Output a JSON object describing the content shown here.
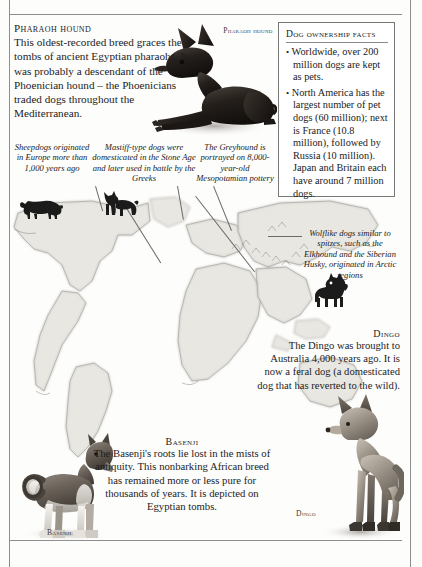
{
  "page": {
    "frame_color": "#8e8e8e",
    "background": "#fdfdfc"
  },
  "pharaoh_hound": {
    "heading": "Pharaoh hound",
    "body": "This oldest-recorded breed graces the tombs of ancient Egyptian pharaohs. It was probably a descendant of the Phoenician hound – the Phoenicians traded dogs throughout the Mediterranean.",
    "photo_label": "Pharaoh hound",
    "photo_name": "pharaoh-hound-photograph"
  },
  "facts_box": {
    "title": "Dog ownership facts",
    "bullet_glyph": "•",
    "items": [
      "Worldwide, over 200 million dogs are kept as pets.",
      "North America has the largest number of pet dogs (60 million); next is France (10.8 million), followed by Russia (10 million). Japan and Britain each have around 7 million dogs."
    ]
  },
  "captions": [
    {
      "id": "sheepdog",
      "text": "Sheepdogs originated in Europe more than 1,000 years ago",
      "silhouette": "sheepdog-silhouette"
    },
    {
      "id": "mastiff",
      "text": "Mastiff-type dogs were domesticated in the Stone Age and later used in battle by the Greeks",
      "silhouette": "mastiff-silhouette"
    },
    {
      "id": "greyhound",
      "text": "The Greyhound is portrayed on 8,000-year-old Mesopotamian pottery",
      "silhouette": null
    },
    {
      "id": "wolflike",
      "text": "Wolflike dogs similar to spitzes, such as the Elkhound and the Siberian Husky, originated in Arctic regions",
      "silhouette": "spitz-silhouette"
    }
  ],
  "dingo": {
    "heading": "Dingo",
    "body": "The Dingo was brought to Australia 4,000 years ago. It is now a feral dog (a domesticated dog that has reverted to the wild).",
    "photo_label": "Dingo",
    "photo_name": "dingo-photograph"
  },
  "basenji": {
    "heading": "Basenji",
    "body": "The Basenji's roots lie lost in the mists of antiquity. This nonbarking African breed has remained more or less pure for thousands of years. It is depicted on Egyptian tombs.",
    "photo_label": "Basenji",
    "photo_name": "basenji-photograph"
  },
  "map": {
    "name": "world-map-illustration",
    "style": "antique engraved hatched coastlines",
    "land_fill": "#e9e7e2",
    "coast_stroke": "#9d9a94"
  }
}
